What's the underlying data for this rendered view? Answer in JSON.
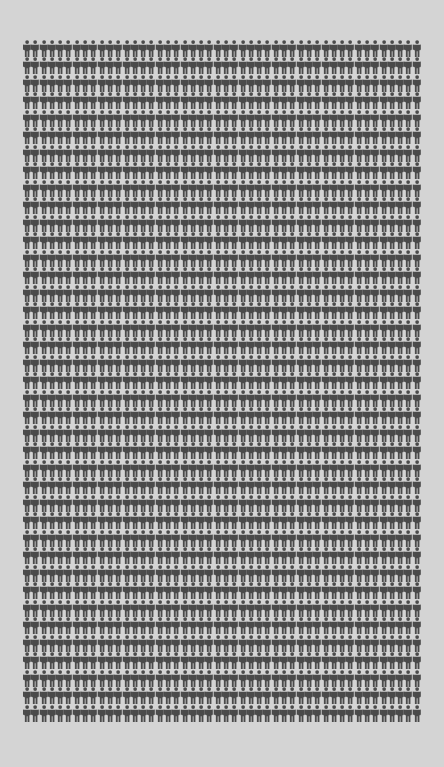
{
  "chart_data": {
    "type": "pictograph",
    "title": "",
    "icon": "person-icon",
    "columns": 48,
    "rows": 39,
    "total_icons": 1872,
    "icon_color": "#4a4a4a",
    "background_color": "#d4d4d4",
    "legend": []
  }
}
